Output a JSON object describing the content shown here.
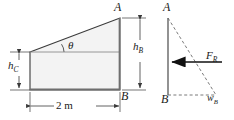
{
  "figure": {
    "colors": {
      "line": "#3a3a3a",
      "fill": "#f3f3f3",
      "dashed": "#6b6b6b",
      "text": "#1a1a1a",
      "background": "#ffffff"
    }
  },
  "left_diagram": {
    "name": "gate-cross-section",
    "labels": {
      "point_a": "A",
      "point_b": "B",
      "angle": "θ",
      "height_b": {
        "base": "h",
        "sub": "B"
      },
      "height_c": {
        "base": "h",
        "sub": "C"
      },
      "width_dimension": "2 m"
    },
    "shape": {
      "type": "trapezoid",
      "vertices": [
        [
          30,
          52
        ],
        [
          120,
          18
        ],
        [
          120,
          90
        ],
        [
          30,
          90
        ]
      ],
      "top_edge": "sloped from left-top to A",
      "internal_horizontal_line_y": 52
    },
    "dimensions": [
      {
        "name": "h_B",
        "orientation": "vertical",
        "from_y": 18,
        "to_y": 90,
        "x": 140
      },
      {
        "name": "h_C",
        "orientation": "vertical",
        "from_y": 52,
        "to_y": 90,
        "x": 18
      },
      {
        "name": "2 m",
        "orientation": "horizontal",
        "from_x": 30,
        "to_x": 120,
        "y": 106
      }
    ]
  },
  "right_diagram": {
    "name": "pressure-distribution",
    "labels": {
      "point_a": "A",
      "point_b": "B",
      "resultant_force": {
        "base": "F",
        "sub": "R"
      },
      "pressure_at_b": {
        "base": "w",
        "sub": "B"
      }
    },
    "shape": {
      "vertical_line": [
        [
          168,
          18
        ],
        [
          168,
          95
        ]
      ],
      "dashed_triangle": [
        [
          168,
          18
        ],
        [
          216,
          95
        ],
        [
          168,
          95
        ]
      ],
      "force_arrow": {
        "from_x": 222,
        "to_x": 170,
        "y": 62,
        "direction": "left"
      }
    }
  }
}
